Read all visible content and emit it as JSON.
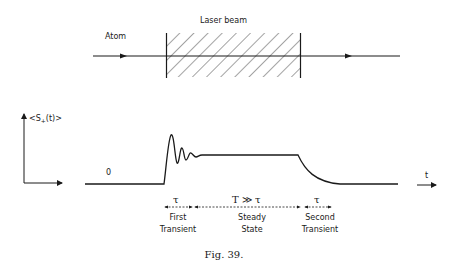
{
  "top_diagram": {
    "laser_label": "Laser beam",
    "atom_label": "Atom"
  },
  "plot": {
    "y_axis_label": "<S+(t)>",
    "x_axis_label": "t",
    "zero_label": "0"
  },
  "intervals": [
    {
      "duration": "τ",
      "line1": "First",
      "line2": "Transient"
    },
    {
      "duration": "T ≫ τ",
      "line1": "Steady",
      "line2": "State"
    },
    {
      "duration": "τ",
      "line1": "Second",
      "line2": "Transient"
    }
  ],
  "caption": "Fig. 39."
}
